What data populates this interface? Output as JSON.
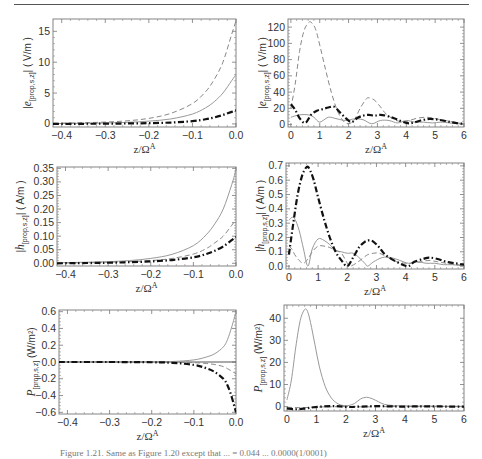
{
  "caption": "Figure 1.21. Same as Figure 1.20 except that ... = 0.044 ... 0.0000(1/0001)",
  "line_styles": {
    "solid": {
      "color": "#999999",
      "width": 1,
      "dash": ""
    },
    "dashed": {
      "color": "#888888",
      "width": 1,
      "dash": "5,3"
    },
    "dashdot": {
      "color": "#111111",
      "width": 2.2,
      "dash": "6,2.5,1.5,2.5"
    }
  },
  "chart_data": [
    {
      "id": "e_left",
      "type": "line",
      "frame": {
        "left": 53,
        "top": 19,
        "right": 236,
        "bottom": 127
      },
      "xlabel": "z/Ω^A",
      "ylabel": "|e(prop,s,z)| ( V/m )",
      "xlim": [
        -0.42,
        0.0
      ],
      "ylim": [
        -0.5,
        17
      ],
      "xticks": [
        -0.4,
        -0.3,
        -0.2,
        -0.1,
        0.0
      ],
      "xticklabels": [
        "-0.4",
        "-0.3",
        "-0.2",
        "-0.1",
        "0.0"
      ],
      "yticks": [
        0,
        5,
        10,
        15
      ],
      "yticklabels": [
        "0",
        "5",
        "10",
        "15"
      ],
      "series": [
        {
          "name": "solid",
          "style": "solid",
          "x": [
            -0.42,
            -0.35,
            -0.3,
            -0.25,
            -0.2,
            -0.15,
            -0.1,
            -0.07,
            -0.05,
            -0.03,
            -0.01,
            0.0
          ],
          "y": [
            0.05,
            0.1,
            0.15,
            0.25,
            0.45,
            0.8,
            1.6,
            2.6,
            3.6,
            5.0,
            7.0,
            8.0
          ]
        },
        {
          "name": "dashed",
          "style": "dashed",
          "x": [
            -0.42,
            -0.35,
            -0.3,
            -0.25,
            -0.2,
            -0.15,
            -0.1,
            -0.07,
            -0.05,
            -0.03,
            -0.01,
            0.0
          ],
          "y": [
            0.1,
            0.2,
            0.3,
            0.5,
            0.9,
            1.7,
            3.3,
            5.2,
            7.2,
            10.0,
            14.5,
            16.7
          ]
        },
        {
          "name": "dashdot",
          "style": "dashdot",
          "x": [
            -0.42,
            -0.35,
            -0.3,
            -0.25,
            -0.2,
            -0.15,
            -0.1,
            -0.07,
            -0.05,
            -0.03,
            -0.01,
            0.0
          ],
          "y": [
            0.0,
            0.02,
            0.04,
            0.07,
            0.12,
            0.22,
            0.45,
            0.75,
            1.05,
            1.45,
            1.95,
            2.2
          ]
        }
      ]
    },
    {
      "id": "e_right",
      "type": "line",
      "frame": {
        "left": 288,
        "top": 19,
        "right": 464,
        "bottom": 127
      },
      "xlabel": "z/Ω^A",
      "ylabel": "|e(prop,s,z)| ( V/m )",
      "xlim": [
        -0.1,
        6.0
      ],
      "ylim": [
        -3,
        130
      ],
      "xticks": [
        0,
        1,
        2,
        3,
        4,
        5,
        6
      ],
      "xticklabels": [
        "0",
        "1",
        "2",
        "3",
        "4",
        "5",
        "6"
      ],
      "yticks": [
        0,
        20,
        40,
        60,
        80,
        100,
        120
      ],
      "yticklabels": [
        "0",
        "20",
        "40",
        "60",
        "80",
        "100",
        "120"
      ],
      "series": [
        {
          "name": "solid",
          "style": "solid",
          "x": [
            0,
            0.3,
            0.6,
            0.8,
            1.0,
            1.3,
            1.6,
            1.9,
            2.2,
            2.5,
            2.8,
            3.1,
            3.4,
            3.7,
            4.0,
            4.3,
            4.6,
            4.9,
            5.2,
            5.5,
            5.8,
            6.0
          ],
          "y": [
            9,
            12,
            12,
            9,
            3,
            9,
            7,
            5,
            7,
            6,
            1,
            5,
            5,
            2,
            5,
            3,
            3,
            2,
            3,
            2,
            1,
            1
          ]
        },
        {
          "name": "dashed",
          "style": "dashed",
          "x": [
            0,
            0.15,
            0.3,
            0.45,
            0.6,
            0.7,
            0.85,
            1.0,
            1.2,
            1.4,
            1.6,
            1.8,
            2.0,
            2.2,
            2.4,
            2.6,
            2.7,
            2.9,
            3.1,
            3.3,
            3.6,
            3.9,
            4.1,
            4.4,
            4.7,
            4.9,
            5.2,
            5.5,
            5.8,
            6.0
          ],
          "y": [
            20,
            50,
            90,
            115,
            125,
            126,
            118,
            98,
            68,
            40,
            18,
            5,
            1,
            6,
            20,
            31,
            33,
            30,
            22,
            13,
            6,
            3,
            5,
            8,
            9,
            8,
            6,
            4,
            2,
            1
          ]
        },
        {
          "name": "dashdot",
          "style": "dashdot",
          "x": [
            0,
            0.15,
            0.3,
            0.5,
            0.7,
            0.9,
            1.1,
            1.3,
            1.5,
            1.7,
            1.9,
            2.1,
            2.3,
            2.5,
            2.7,
            2.9,
            3.1,
            3.4,
            3.7,
            4.0,
            4.2,
            4.5,
            4.8,
            5.1,
            5.4,
            5.7,
            6.0
          ],
          "y": [
            25,
            18,
            8,
            2,
            12,
            17,
            19,
            21,
            22,
            15,
            8,
            3,
            8,
            11,
            12,
            11,
            12,
            10,
            6,
            2,
            2,
            5,
            7,
            6,
            4,
            2,
            1
          ]
        }
      ]
    },
    {
      "id": "h_left",
      "type": "line",
      "frame": {
        "left": 57,
        "top": 167,
        "right": 236,
        "bottom": 266
      },
      "xlabel": "z/Ω^A",
      "ylabel": "|h(prop,s,z)| ( A/m )",
      "xlim": [
        -0.42,
        0.0
      ],
      "ylim": [
        -0.01,
        0.355
      ],
      "xticks": [
        -0.4,
        -0.3,
        -0.2,
        -0.1,
        0.0
      ],
      "xticklabels": [
        "-0.4",
        "-0.3",
        "-0.2",
        "-0.1",
        "0.0"
      ],
      "yticks": [
        0.0,
        0.05,
        0.1,
        0.15,
        0.2,
        0.25,
        0.3,
        0.35
      ],
      "yticklabels": [
        "0.00",
        "0.05",
        "0.10",
        "0.15",
        "0.20",
        "0.25",
        "0.30",
        "0.35"
      ],
      "series": [
        {
          "name": "solid",
          "style": "solid",
          "x": [
            -0.42,
            -0.35,
            -0.3,
            -0.25,
            -0.2,
            -0.15,
            -0.1,
            -0.07,
            -0.05,
            -0.03,
            -0.01,
            0.0
          ],
          "y": [
            0.002,
            0.004,
            0.006,
            0.01,
            0.018,
            0.033,
            0.065,
            0.105,
            0.145,
            0.2,
            0.29,
            0.345
          ]
        },
        {
          "name": "dashed",
          "style": "dashed",
          "x": [
            -0.42,
            -0.35,
            -0.3,
            -0.25,
            -0.2,
            -0.15,
            -0.1,
            -0.07,
            -0.05,
            -0.03,
            -0.01,
            0.0
          ],
          "y": [
            0.001,
            0.002,
            0.004,
            0.006,
            0.01,
            0.018,
            0.034,
            0.054,
            0.075,
            0.1,
            0.14,
            0.162
          ]
        },
        {
          "name": "dashdot",
          "style": "dashdot",
          "x": [
            -0.42,
            -0.35,
            -0.3,
            -0.25,
            -0.2,
            -0.15,
            -0.1,
            -0.07,
            -0.05,
            -0.03,
            -0.01,
            0.0
          ],
          "y": [
            0.0,
            0.001,
            0.002,
            0.004,
            0.007,
            0.012,
            0.022,
            0.034,
            0.046,
            0.062,
            0.085,
            0.097
          ]
        }
      ]
    },
    {
      "id": "h_right",
      "type": "line",
      "frame": {
        "left": 286,
        "top": 163,
        "right": 464,
        "bottom": 269
      },
      "xlabel": "z/Ω^A",
      "ylabel": "|h(prop,s,z)| ( A/m )",
      "xlim": [
        -0.1,
        6.0
      ],
      "ylim": [
        -0.02,
        0.72
      ],
      "xticks": [
        0,
        1,
        2,
        3,
        4,
        5,
        6
      ],
      "xticklabels": [
        "0",
        "1",
        "2",
        "3",
        "4",
        "5",
        "6"
      ],
      "yticks": [
        0.0,
        0.1,
        0.2,
        0.3,
        0.4,
        0.5,
        0.6,
        0.7
      ],
      "yticklabels": [
        "0.0",
        "0.1",
        "0.2",
        "0.3",
        "0.4",
        "0.5",
        "0.6",
        "0.7"
      ],
      "series": [
        {
          "name": "solid",
          "style": "solid",
          "x": [
            0,
            0.1,
            0.2,
            0.35,
            0.5,
            0.65,
            0.8,
            1.0,
            1.2,
            1.4,
            1.6,
            1.8,
            2.0,
            2.2,
            2.4,
            2.6,
            2.7,
            2.9,
            3.2,
            3.5,
            3.8,
            4.1,
            4.4,
            4.7,
            5.0,
            5.3,
            5.6,
            6.0
          ],
          "y": [
            0.32,
            0.34,
            0.33,
            0.25,
            0.12,
            0.0,
            0.12,
            0.19,
            0.18,
            0.15,
            0.11,
            0.1,
            0.09,
            0.09,
            0.06,
            0.02,
            0.0,
            0.03,
            0.06,
            0.06,
            0.04,
            0.02,
            0.03,
            0.02,
            0.02,
            0.01,
            0.01,
            0.0
          ]
        },
        {
          "name": "dashed",
          "style": "dashed",
          "x": [
            0,
            0.1,
            0.2,
            0.35,
            0.5,
            0.65,
            0.8,
            1.0,
            1.2,
            1.4,
            1.6,
            1.8,
            2.0,
            2.1,
            2.3,
            2.5,
            2.7,
            2.9,
            3.1,
            3.4,
            3.7,
            4.0,
            4.2,
            4.5,
            4.8,
            5.1,
            5.4,
            5.7,
            6.0
          ],
          "y": [
            0.14,
            0.12,
            0.08,
            0.04,
            0.02,
            0.05,
            0.1,
            0.14,
            0.14,
            0.13,
            0.11,
            0.09,
            0.02,
            0.0,
            0.02,
            0.05,
            0.08,
            0.09,
            0.09,
            0.06,
            0.03,
            0.02,
            0.02,
            0.03,
            0.04,
            0.03,
            0.02,
            0.01,
            0.01
          ]
        },
        {
          "name": "dashdot",
          "style": "dashdot",
          "x": [
            0,
            0.15,
            0.3,
            0.45,
            0.6,
            0.7,
            0.85,
            1.0,
            1.2,
            1.4,
            1.6,
            1.8,
            2.0,
            2.2,
            2.4,
            2.6,
            2.75,
            2.9,
            3.1,
            3.3,
            3.6,
            3.9,
            4.1,
            4.3,
            4.6,
            4.8,
            5.1,
            5.4,
            5.7,
            6.0
          ],
          "y": [
            0.08,
            0.3,
            0.5,
            0.63,
            0.69,
            0.68,
            0.6,
            0.48,
            0.33,
            0.2,
            0.1,
            0.04,
            0.0,
            0.06,
            0.13,
            0.17,
            0.18,
            0.17,
            0.13,
            0.08,
            0.04,
            0.01,
            0.0,
            0.03,
            0.05,
            0.06,
            0.05,
            0.03,
            0.02,
            0.01
          ]
        }
      ]
    },
    {
      "id": "p_left",
      "type": "line",
      "frame": {
        "left": 59,
        "top": 310,
        "right": 236,
        "bottom": 414
      },
      "xlabel": "z/Ω^A",
      "ylabel": "P(prop,s,z) (W/m²)",
      "xlim": [
        -0.42,
        0.0
      ],
      "ylim": [
        -0.62,
        0.62
      ],
      "xticks": [
        -0.4,
        -0.3,
        -0.2,
        -0.1,
        0.0
      ],
      "xticklabels": [
        "-0.4",
        "-0.3",
        "-0.2",
        "-0.1",
        "0.0"
      ],
      "yticks": [
        -0.6,
        -0.4,
        -0.2,
        0.0,
        0.2,
        0.4,
        0.6
      ],
      "yticklabels": [
        "-0.6",
        "-0.4",
        "-0.2",
        "0.0",
        "0.2",
        "0.4",
        "0.6"
      ],
      "zero_line": true,
      "series": [
        {
          "name": "solid",
          "style": "solid",
          "x": [
            -0.42,
            -0.3,
            -0.2,
            -0.15,
            -0.1,
            -0.07,
            -0.05,
            -0.03,
            -0.02,
            -0.01,
            0.0
          ],
          "y": [
            0.0,
            0.0,
            0.002,
            0.006,
            0.025,
            0.06,
            0.1,
            0.18,
            0.27,
            0.42,
            0.6
          ]
        },
        {
          "name": "dashed",
          "style": "dashed",
          "x": [
            -0.42,
            -0.3,
            -0.2,
            -0.15,
            -0.1,
            -0.07,
            -0.05,
            -0.03,
            -0.02,
            -0.01,
            0.0
          ],
          "y": [
            0.0,
            0.0,
            -0.001,
            -0.003,
            -0.008,
            -0.018,
            -0.03,
            -0.055,
            -0.08,
            -0.11,
            -0.14
          ]
        },
        {
          "name": "dashdot",
          "style": "dashdot",
          "x": [
            -0.42,
            -0.3,
            -0.2,
            -0.15,
            -0.1,
            -0.07,
            -0.05,
            -0.03,
            -0.02,
            -0.01,
            0.0
          ],
          "y": [
            0.0,
            0.0,
            -0.003,
            -0.01,
            -0.035,
            -0.075,
            -0.12,
            -0.2,
            -0.28,
            -0.42,
            -0.6
          ]
        }
      ]
    },
    {
      "id": "p_right",
      "type": "line",
      "frame": {
        "left": 284,
        "top": 305,
        "right": 464,
        "bottom": 411
      },
      "xlabel": "z/Ω^A",
      "ylabel": "P(prop,s,z) (W/m²)",
      "xlim": [
        -0.1,
        6.0
      ],
      "ylim": [
        -2,
        46
      ],
      "xticks": [
        0,
        1,
        2,
        3,
        4,
        5,
        6
      ],
      "xticklabels": [
        "0",
        "1",
        "2",
        "3",
        "4",
        "5",
        "6"
      ],
      "yticks": [
        0,
        10,
        20,
        30,
        40
      ],
      "yticklabels": [
        "0",
        "10",
        "20",
        "30",
        "40"
      ],
      "series": [
        {
          "name": "solid",
          "style": "solid",
          "x": [
            0,
            0.15,
            0.3,
            0.45,
            0.6,
            0.7,
            0.8,
            0.95,
            1.1,
            1.3,
            1.5,
            1.7,
            1.9,
            2.1,
            2.3,
            2.5,
            2.7,
            2.9,
            3.1,
            3.3,
            3.6,
            4.0,
            5.0,
            6.0
          ],
          "y": [
            3,
            12,
            27,
            39,
            44,
            43,
            38,
            28,
            18,
            9,
            4,
            1.5,
            0.5,
            0.5,
            1.5,
            3.5,
            4.2,
            3.5,
            2.2,
            1.0,
            0.5,
            0.3,
            0.2,
            0.1
          ]
        },
        {
          "name": "dashed",
          "style": "dashed",
          "x": [
            0,
            0.5,
            1.0,
            1.5,
            2.0,
            2.5,
            3.0,
            3.5,
            4.0,
            4.5,
            5.0,
            5.5,
            6.0
          ],
          "y": [
            -0.3,
            -0.5,
            -0.2,
            -0.1,
            0,
            -0.1,
            -0.1,
            0,
            0,
            0,
            0,
            0,
            0
          ]
        },
        {
          "name": "dashdot",
          "style": "dashdot",
          "x": [
            0,
            0.3,
            0.6,
            0.9,
            1.2,
            1.5,
            1.8,
            2.1,
            2.5,
            3.0,
            3.5,
            4.0,
            4.5,
            5.0,
            5.5,
            6.0
          ],
          "y": [
            -0.8,
            -1.2,
            -0.9,
            -0.3,
            0.0,
            0.2,
            0.1,
            -0.2,
            0.0,
            0.2,
            0.1,
            0.0,
            0.1,
            0.1,
            0.0,
            0.0
          ]
        }
      ]
    }
  ]
}
